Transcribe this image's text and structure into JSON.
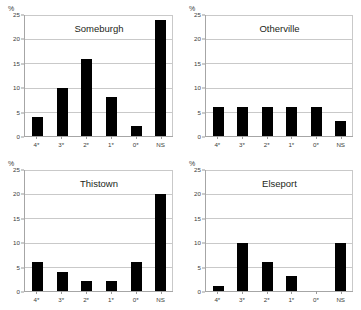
{
  "figure": {
    "background_color": "#ffffff",
    "bar_color": "#000000",
    "grid_color": "#c9c9c9",
    "axis_color": "#a6a6a6",
    "unit_label": "%"
  },
  "chart_data": [
    {
      "type": "bar",
      "title": "Someburgh",
      "categories": [
        "4*",
        "3*",
        "2*",
        "1*",
        "0*",
        "NS"
      ],
      "values": [
        4,
        10,
        16,
        8,
        2,
        24
      ],
      "xlabel": "",
      "ylabel": "%",
      "ylim": [
        0,
        25
      ],
      "yticks": [
        0,
        5,
        10,
        15,
        20,
        25
      ],
      "grid": true,
      "legend": "none"
    },
    {
      "type": "bar",
      "title": "Otherville",
      "categories": [
        "4*",
        "3*",
        "2*",
        "1*",
        "0*",
        "NS"
      ],
      "values": [
        6,
        6,
        6,
        6,
        6,
        3
      ],
      "xlabel": "",
      "ylabel": "%",
      "ylim": [
        0,
        25
      ],
      "yticks": [
        0,
        5,
        10,
        15,
        20,
        25
      ],
      "grid": true,
      "legend": "none"
    },
    {
      "type": "bar",
      "title": "Thistown",
      "categories": [
        "4*",
        "3*",
        "2*",
        "1*",
        "0*",
        "NS"
      ],
      "values": [
        6,
        4,
        2,
        2,
        6,
        20
      ],
      "xlabel": "",
      "ylabel": "%",
      "ylim": [
        0,
        25
      ],
      "yticks": [
        0,
        5,
        10,
        15,
        20,
        25
      ],
      "grid": true,
      "legend": "none"
    },
    {
      "type": "bar",
      "title": "Elseport",
      "categories": [
        "4*",
        "3*",
        "2*",
        "1*",
        "0*",
        "NS"
      ],
      "values": [
        1,
        10,
        6,
        3,
        0,
        10
      ],
      "xlabel": "",
      "ylabel": "%",
      "ylim": [
        0,
        25
      ],
      "yticks": [
        0,
        5,
        10,
        15,
        20,
        25
      ],
      "grid": true,
      "legend": "none"
    }
  ]
}
